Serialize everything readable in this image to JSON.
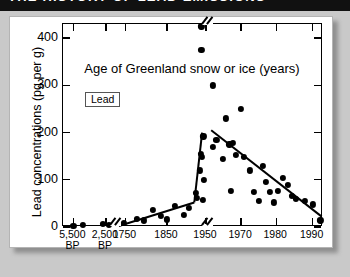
{
  "banner": {
    "title": "THE HISTORY OF LEAD EMISSIONS"
  },
  "legend": {
    "label": "Lead"
  },
  "chart_data": {
    "type": "scatter",
    "title": "THE HISTORY OF LEAD EMISSIONS",
    "xlabel": "Age of Greenland snow or ice (years)",
    "ylabel": "Lead concentrations (pg per g)",
    "ylim": [
      0,
      430
    ],
    "yticks": [
      0,
      100,
      200,
      300,
      400
    ],
    "ytick_labels": [
      "0",
      "100",
      "200",
      "300",
      "400"
    ],
    "grid": false,
    "legend_position": "upper-left-inside",
    "legend_entries": [
      "Lead"
    ],
    "axis_note": "x-axis is broken into segments: ancient BP samples, 1750-1950 historical, 1950-1990 modern",
    "xtick_labels": [
      {
        "line1": "5,500",
        "line2": "BP"
      },
      {
        "line1": "2,500",
        "line2": "BP"
      },
      {
        "line1": "1750",
        "line2": ""
      },
      {
        "line1": "1850",
        "line2": ""
      },
      {
        "line1": "1950",
        "line2": ""
      },
      {
        "line1": "1970",
        "line2": ""
      },
      {
        "line1": "1980",
        "line2": ""
      },
      {
        "line1": "1990",
        "line2": ""
      }
    ],
    "axis_breaks": [
      {
        "position_pct": 20.0,
        "edge": "bottom"
      },
      {
        "position_pct": 55.5,
        "edge": "bottom"
      },
      {
        "position_pct": 55.5,
        "edge": "top"
      }
    ],
    "series": [
      {
        "name": "Lead",
        "points": [
          {
            "x_pct": 4.0,
            "value": 3
          },
          {
            "x_pct": 7.5,
            "value": 4
          },
          {
            "x_pct": 15.5,
            "value": 6
          },
          {
            "x_pct": 17.5,
            "value": 5
          },
          {
            "x_pct": 23.5,
            "value": 8
          },
          {
            "x_pct": 28.5,
            "value": 18
          },
          {
            "x_pct": 31.0,
            "value": 14
          },
          {
            "x_pct": 34.5,
            "value": 36
          },
          {
            "x_pct": 37.5,
            "value": 24
          },
          {
            "x_pct": 40.0,
            "value": 16
          },
          {
            "x_pct": 43.0,
            "value": 45
          },
          {
            "x_pct": 46.5,
            "value": 26
          },
          {
            "x_pct": 48.5,
            "value": 41
          },
          {
            "x_pct": 51.0,
            "value": 72
          },
          {
            "x_pct": 51.5,
            "value": 62
          },
          {
            "x_pct": 52.5,
            "value": 120
          },
          {
            "x_pct": 53.0,
            "value": 155
          },
          {
            "x_pct": 53.5,
            "value": 148
          },
          {
            "x_pct": 54.0,
            "value": 192
          },
          {
            "x_pct": 53.8,
            "value": 58
          },
          {
            "x_pct": 54.2,
            "value": 100
          },
          {
            "x_pct": 53.2,
            "value": 425
          },
          {
            "x_pct": 53.2,
            "value": 375
          },
          {
            "x_pct": 57.5,
            "value": 300
          },
          {
            "x_pct": 57.8,
            "value": 170
          },
          {
            "x_pct": 59.0,
            "value": 185
          },
          {
            "x_pct": 61.5,
            "value": 145
          },
          {
            "x_pct": 62.5,
            "value": 230
          },
          {
            "x_pct": 64.0,
            "value": 175
          },
          {
            "x_pct": 64.5,
            "value": 76
          },
          {
            "x_pct": 65.5,
            "value": 178
          },
          {
            "x_pct": 66.5,
            "value": 152
          },
          {
            "x_pct": 68.5,
            "value": 250
          },
          {
            "x_pct": 69.5,
            "value": 148
          },
          {
            "x_pct": 72.0,
            "value": 120
          },
          {
            "x_pct": 73.5,
            "value": 74
          },
          {
            "x_pct": 75.5,
            "value": 55
          },
          {
            "x_pct": 77.0,
            "value": 130
          },
          {
            "x_pct": 78.0,
            "value": 96
          },
          {
            "x_pct": 79.5,
            "value": 74
          },
          {
            "x_pct": 81.0,
            "value": 52
          },
          {
            "x_pct": 82.5,
            "value": 76
          },
          {
            "x_pct": 84.5,
            "value": 104
          },
          {
            "x_pct": 86.5,
            "value": 90
          },
          {
            "x_pct": 88.0,
            "value": 66
          },
          {
            "x_pct": 89.5,
            "value": 60
          },
          {
            "x_pct": 93.0,
            "value": 55
          },
          {
            "x_pct": 96.0,
            "value": 48
          },
          {
            "x_pct": 99.0,
            "value": 14
          }
        ]
      }
    ],
    "trend_lines": [
      {
        "name": "pre-industrial-rise",
        "from": {
          "x_pct": 21.5,
          "value": 2
        },
        "to": {
          "x_pct": 50.5,
          "value": 52
        }
      },
      {
        "name": "mid-century-spike",
        "from": {
          "x_pct": 50.5,
          "value": 52
        },
        "to": {
          "x_pct": 53.5,
          "value": 200
        }
      },
      {
        "name": "modern-decline",
        "from": {
          "x_pct": 57.0,
          "value": 205
        },
        "to": {
          "x_pct": 99.5,
          "value": 22
        }
      }
    ]
  }
}
